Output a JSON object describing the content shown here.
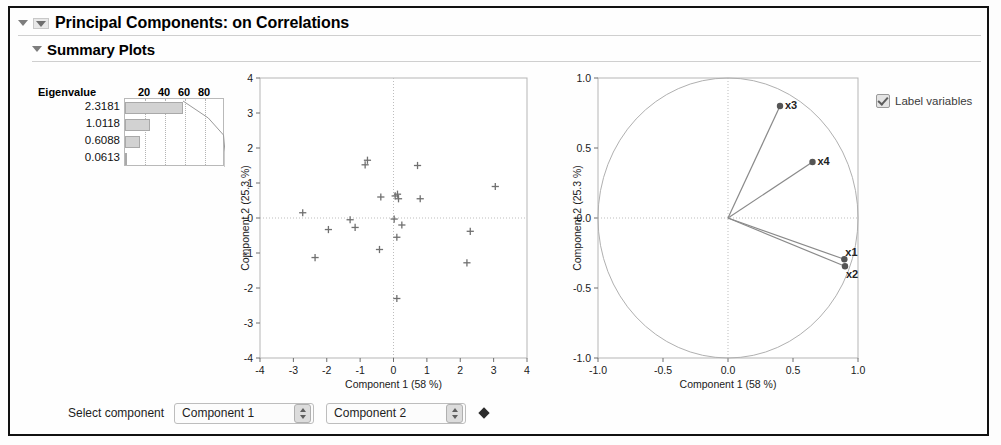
{
  "window": {
    "title": "Principal Components: on Correlations",
    "section_title": "Summary Plots"
  },
  "eigen_table": {
    "header_label": "Eigenvalue",
    "tick_labels": [
      "20",
      "40",
      "60",
      "80"
    ],
    "values": [
      "2.3181",
      "1.0118",
      "0.6088",
      "0.0613"
    ],
    "percents": [
      58.0,
      25.3,
      15.2,
      1.5
    ]
  },
  "options": {
    "label_variables": "Label variables",
    "label_variables_checked": true
  },
  "footer": {
    "select_component_label": "Select component",
    "component_x": "Component 1",
    "component_y": "Component 2"
  },
  "chart_data": [
    {
      "type": "scatter",
      "name": "score-plot",
      "title": "",
      "xlabel": "Component 1  (58 %)",
      "ylabel": "Component 2  (25.3 %)",
      "xlim": [
        -4,
        4
      ],
      "ylim": [
        -4,
        4
      ],
      "xticks": [
        -4,
        -3,
        -2,
        -1,
        0,
        1,
        2,
        3,
        4
      ],
      "yticks": [
        -4,
        -3,
        -2,
        -1,
        0,
        1,
        2,
        3,
        4
      ],
      "grid": true,
      "marker": "plus",
      "points": [
        [
          -2.72,
          0.15
        ],
        [
          -2.35,
          -1.13
        ],
        [
          -1.95,
          -0.33
        ],
        [
          -1.3,
          -0.05
        ],
        [
          -1.15,
          -0.27
        ],
        [
          -0.85,
          1.52
        ],
        [
          -0.78,
          1.65
        ],
        [
          -0.38,
          0.6
        ],
        [
          -0.42,
          -0.9
        ],
        [
          0.02,
          -0.03
        ],
        [
          0.05,
          0.63
        ],
        [
          0.12,
          0.68
        ],
        [
          0.15,
          0.55
        ],
        [
          0.25,
          -0.2
        ],
        [
          0.1,
          -0.55
        ],
        [
          0.1,
          -2.3
        ],
        [
          0.72,
          1.5
        ],
        [
          0.8,
          0.55
        ],
        [
          2.3,
          -0.38
        ],
        [
          2.2,
          -1.28
        ],
        [
          3.05,
          0.9
        ]
      ]
    },
    {
      "type": "scatter",
      "name": "loading-plot",
      "title": "",
      "xlabel": "Component 1  (58 %)",
      "ylabel": "Component 2  (25.3 %)",
      "xlim": [
        -1.0,
        1.0
      ],
      "ylim": [
        -1.0,
        1.0
      ],
      "xticks": [
        -1.0,
        -0.5,
        0.0,
        0.5,
        1.0
      ],
      "yticks": [
        -1.0,
        -0.5,
        0.0,
        0.5,
        1.0
      ],
      "xtick_labels": [
        "-1.0",
        "-0.5",
        "0.0",
        "0.5",
        "1.0"
      ],
      "ytick_labels": [
        "-1.0",
        "-0.5",
        "0.0",
        "0.5",
        "1.0"
      ],
      "grid": true,
      "unit_circle": true,
      "vectors": [
        {
          "label": "x1",
          "x": 0.895,
          "y": -0.295
        },
        {
          "label": "x2",
          "x": 0.9,
          "y": -0.345
        },
        {
          "label": "x3",
          "x": 0.4,
          "y": 0.8
        },
        {
          "label": "x4",
          "x": 0.65,
          "y": 0.4
        }
      ]
    }
  ]
}
